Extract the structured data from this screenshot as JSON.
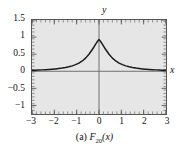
{
  "caption": {
    "prefix": "(a) ",
    "func": "F",
    "subscript": "20",
    "arg": "(x)",
    "full": "(a) F20(x)"
  },
  "axes": {
    "x_letter": "x",
    "y_letter": "y",
    "x_ticks": [
      "-3",
      "-2",
      "-1",
      "0",
      "1",
      "2",
      "3"
    ],
    "x_tick_values": [
      -3,
      -2,
      -1,
      0,
      1,
      2,
      3
    ],
    "y_ticks": [
      "1.5",
      "1",
      "0.5",
      "0",
      "-0.5",
      "-1"
    ],
    "y_tick_values": [
      1.5,
      1,
      0.5,
      0,
      -0.5,
      -1
    ]
  },
  "colors": {
    "plot_background": "#e6e6e6",
    "frame": "#555555",
    "curve": "#1a1a1a",
    "axis_line": "#6e6e6e",
    "text": "#111111",
    "page_background": "#ffffff"
  },
  "chart_data": {
    "type": "line",
    "title": "(a) F20(x)",
    "xlabel": "x",
    "ylabel": "y",
    "xlim": [
      -3,
      3
    ],
    "ylim": [
      -1.25,
      1.5
    ],
    "grid": false,
    "legend": null,
    "series": [
      {
        "name": "F20(x)",
        "x": [
          -3.0,
          -2.85,
          -2.7,
          -2.55,
          -2.4,
          -2.25,
          -2.1,
          -1.95,
          -1.8,
          -1.65,
          -1.5,
          -1.35,
          -1.2,
          -1.05,
          -0.9,
          -0.75,
          -0.6,
          -0.45,
          -0.3,
          -0.21,
          -0.15,
          -0.09,
          -0.045,
          0.0,
          0.045,
          0.09,
          0.15,
          0.21,
          0.3,
          0.45,
          0.6,
          0.75,
          0.9,
          1.05,
          1.2,
          1.35,
          1.5,
          1.65,
          1.8,
          1.95,
          2.1,
          2.25,
          2.4,
          2.55,
          2.7,
          2.85,
          3.0
        ],
        "y": [
          0.03,
          0.033,
          0.037,
          0.041,
          0.046,
          0.052,
          0.06,
          0.069,
          0.08,
          0.093,
          0.11,
          0.131,
          0.158,
          0.193,
          0.239,
          0.301,
          0.385,
          0.498,
          0.637,
          0.73,
          0.793,
          0.855,
          0.896,
          0.93,
          0.896,
          0.855,
          0.793,
          0.73,
          0.637,
          0.498,
          0.385,
          0.301,
          0.239,
          0.193,
          0.158,
          0.131,
          0.11,
          0.093,
          0.08,
          0.069,
          0.06,
          0.052,
          0.046,
          0.041,
          0.037,
          0.033,
          0.03
        ]
      }
    ]
  }
}
